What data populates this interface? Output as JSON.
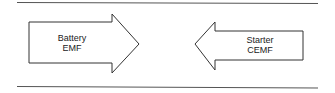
{
  "diagram": {
    "left_arrow": {
      "direction": "right",
      "line1": "Battery",
      "line2": "EMF"
    },
    "right_arrow": {
      "direction": "left",
      "line1": "Starter",
      "line2": "CEMF"
    },
    "colors": {
      "stroke": "#333333",
      "background": "#ffffff"
    }
  }
}
